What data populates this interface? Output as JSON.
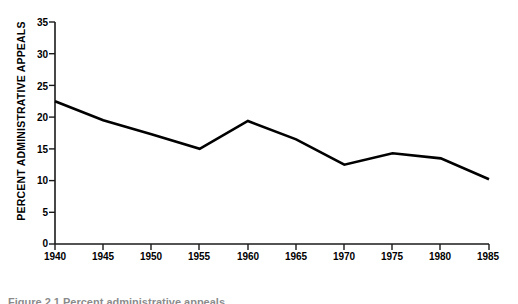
{
  "chart_data": {
    "type": "line",
    "title": "",
    "xlabel": "YEAR",
    "ylabel": "PERCENT ADMINISTRATIVE APPEALS",
    "x": [
      1940,
      1945,
      1950,
      1955,
      1960,
      1965,
      1970,
      1975,
      1980,
      1985
    ],
    "values": [
      22.5,
      19.5,
      17.3,
      15.0,
      19.4,
      16.5,
      12.5,
      14.3,
      13.5,
      10.2
    ],
    "series": [
      {
        "name": "Percent administrative appeals",
        "values": [
          22.5,
          19.5,
          17.3,
          15.0,
          19.4,
          16.5,
          12.5,
          14.3,
          13.5,
          10.2
        ]
      }
    ],
    "xlim": [
      1940,
      1985
    ],
    "ylim": [
      0,
      35
    ],
    "xticks": [
      "1940",
      "1945",
      "1950",
      "1955",
      "1960",
      "1965",
      "1970",
      "1975",
      "1980",
      "1985"
    ],
    "yticks": [
      "0",
      "5",
      "10",
      "15",
      "20",
      "25",
      "30",
      "35"
    ],
    "grid": false,
    "legend": false,
    "legend_position": "none",
    "line_color": "#000000",
    "axis_color": "#1a1a1a",
    "background_color": "#ffffff"
  },
  "caption": {
    "text": "Figure 2.1  Percent administrative appeals"
  }
}
